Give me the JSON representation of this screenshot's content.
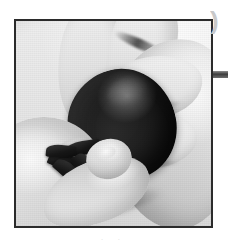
{
  "page": {
    "background_color": "#ffffff",
    "width": 228,
    "height": 247
  },
  "photo": {
    "kind": "photograph",
    "style": "black-and-white halftone print",
    "subject": "two hands removing the green hull from a ripe strawberry",
    "alt_text": "Close-up black and white photo of hands hulling a strawberry",
    "frame": {
      "border_color": "#2b2b2b",
      "border_width_px": 2,
      "left": 14,
      "top": 19,
      "width": 199,
      "height": 209
    },
    "elements": {
      "berry_label": "strawberry",
      "hull_label": "calyx-hull",
      "upper_hand_label": "upper-hand",
      "right_hand_label": "right-hand",
      "lower_hand_label": "lower-hand",
      "thumb_label": "thumb",
      "fingertip_label": "fingertip",
      "surface_label": "work-surface"
    },
    "colors": {
      "berry_dark": "#1a1a19",
      "seed_light": "#9a9a96",
      "hull_dark": "#171716",
      "skin_light": "#f1f0ee",
      "skin_shadow": "#c9c8c4",
      "surface": "#e4e4e0"
    }
  },
  "artifacts": {
    "corner_glyph": ")",
    "edge_bar_color": "#3c3c3c",
    "caption_text": "· ·"
  }
}
